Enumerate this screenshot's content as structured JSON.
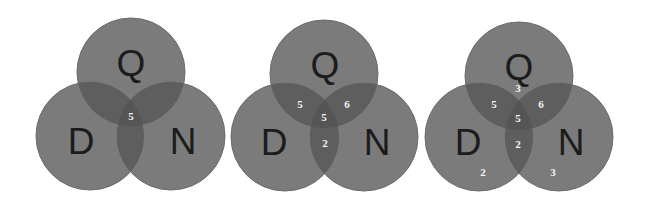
{
  "colors": {
    "background": "#ffffff",
    "circle_fill": "#7b7b7b",
    "circle_edge": "#6c6c6c",
    "overlap_fill": "#555555",
    "label_color": "#1c1c1c",
    "count_color": "#f4f4f4"
  },
  "diagrams": [
    {
      "name": "venn-1",
      "sets": {
        "Q": {
          "label": "Q",
          "cx": 131,
          "cy": 72
        },
        "D": {
          "label": "D",
          "cx": 90,
          "cy": 136
        },
        "N": {
          "label": "N",
          "cx": 171,
          "cy": 136
        }
      },
      "radius": 54,
      "counts": {
        "QDN": "5"
      }
    },
    {
      "name": "venn-2",
      "sets": {
        "Q": {
          "label": "Q",
          "cx": 324,
          "cy": 74
        },
        "D": {
          "label": "D",
          "cx": 285,
          "cy": 137
        },
        "N": {
          "label": "N",
          "cx": 364,
          "cy": 137
        }
      },
      "radius": 54,
      "counts": {
        "QD": "5",
        "QN": "6",
        "QDN": "5",
        "DN": "2"
      }
    },
    {
      "name": "venn-3",
      "sets": {
        "Q": {
          "label": "Q",
          "cx": 519,
          "cy": 76
        },
        "D": {
          "label": "D",
          "cx": 479,
          "cy": 137
        },
        "N": {
          "label": "N",
          "cx": 559,
          "cy": 137
        }
      },
      "radius": 54,
      "counts": {
        "Q": "3",
        "QD": "5",
        "QN": "6",
        "QDN": "5",
        "DN": "2",
        "D": "2",
        "N": "3"
      }
    }
  ]
}
